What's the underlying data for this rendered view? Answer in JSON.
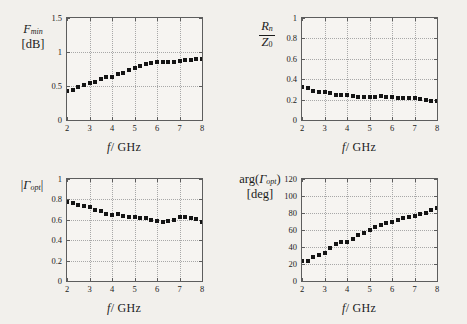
{
  "figure": {
    "background": "#f2f0ec",
    "marker_color": "#141414",
    "axis_color": "#5d5d5d",
    "grid_color": "#a8a8a8"
  },
  "chart_data": [
    {
      "type": "scatter",
      "panel": "top-left",
      "title": "",
      "ylabel": "F_min [dB]",
      "ylabel_parts": {
        "main": "F",
        "sub": "min",
        "unit": "[dB]"
      },
      "xlabel": "f / GHz",
      "xlim": [
        2,
        8
      ],
      "ylim": [
        0,
        1.5
      ],
      "xticks": [
        2,
        3,
        4,
        5,
        6,
        7,
        8
      ],
      "yticks": [
        0,
        0.5,
        1,
        1.5
      ],
      "xticklabels": [
        "2",
        "3",
        "4",
        "5",
        "6",
        "7",
        "8"
      ],
      "yticklabels": [
        "0",
        "0.5",
        "1",
        "1.5"
      ],
      "grid": true,
      "legend": "none",
      "x": [
        2.0,
        2.25,
        2.5,
        2.75,
        3.0,
        3.25,
        3.5,
        3.75,
        4.0,
        4.25,
        4.5,
        4.75,
        5.0,
        5.25,
        5.5,
        5.75,
        6.0,
        6.25,
        6.5,
        6.75,
        7.0,
        7.25,
        7.5,
        7.75,
        8.0
      ],
      "values": [
        0.43,
        0.44,
        0.49,
        0.52,
        0.55,
        0.56,
        0.6,
        0.63,
        0.63,
        0.67,
        0.69,
        0.73,
        0.76,
        0.8,
        0.82,
        0.84,
        0.85,
        0.85,
        0.86,
        0.86,
        0.87,
        0.88,
        0.88,
        0.89,
        0.9
      ]
    },
    {
      "type": "scatter",
      "panel": "top-right",
      "title": "",
      "ylabel": "Rn / Z0",
      "ylabel_parts": {
        "numerator_main": "R",
        "numerator_sub": "n",
        "denominator_main": "Z",
        "denominator_sub": "0"
      },
      "xlabel": "f / GHz",
      "xlim": [
        2,
        8
      ],
      "ylim": [
        0,
        1
      ],
      "xticks": [
        2,
        3,
        4,
        5,
        6,
        7,
        8
      ],
      "yticks": [
        0,
        0.2,
        0.4,
        0.6,
        0.8,
        1
      ],
      "xticklabels": [
        "2",
        "3",
        "4",
        "5",
        "6",
        "7",
        "8"
      ],
      "yticklabels": [
        "0",
        "0.2",
        "0.4",
        "0.6",
        "0.8",
        "1"
      ],
      "grid": true,
      "legend": "none",
      "x": [
        2.0,
        2.25,
        2.5,
        2.75,
        3.0,
        3.25,
        3.5,
        3.75,
        4.0,
        4.25,
        4.5,
        4.75,
        5.0,
        5.25,
        5.5,
        5.75,
        6.0,
        6.25,
        6.5,
        6.75,
        7.0,
        7.25,
        7.5,
        7.75,
        8.0
      ],
      "values": [
        0.32,
        0.31,
        0.28,
        0.27,
        0.275,
        0.26,
        0.25,
        0.25,
        0.245,
        0.235,
        0.23,
        0.225,
        0.23,
        0.225,
        0.235,
        0.225,
        0.225,
        0.22,
        0.215,
        0.215,
        0.22,
        0.205,
        0.2,
        0.185,
        0.19
      ]
    },
    {
      "type": "scatter",
      "panel": "bottom-left",
      "title": "",
      "ylabel": "|Gamma_opt|",
      "ylabel_parts": {
        "main": "Γ",
        "sub": "opt"
      },
      "xlabel": "f / GHz",
      "xlim": [
        2,
        8
      ],
      "ylim": [
        0,
        1
      ],
      "xticks": [
        2,
        3,
        4,
        5,
        6,
        7,
        8
      ],
      "yticks": [
        0,
        0.2,
        0.4,
        0.6,
        0.8,
        1
      ],
      "xticklabels": [
        "2",
        "3",
        "4",
        "5",
        "6",
        "7",
        "8"
      ],
      "yticklabels": [
        "0",
        "0.2",
        "0.4",
        "0.6",
        "0.8",
        "1"
      ],
      "grid": true,
      "legend": "none",
      "x": [
        2.0,
        2.25,
        2.5,
        2.75,
        3.0,
        3.25,
        3.5,
        3.75,
        4.0,
        4.25,
        4.5,
        4.75,
        5.0,
        5.25,
        5.5,
        5.75,
        6.0,
        6.25,
        6.5,
        6.75,
        7.0,
        7.25,
        7.5,
        7.75,
        8.0
      ],
      "values": [
        0.77,
        0.765,
        0.75,
        0.735,
        0.73,
        0.695,
        0.685,
        0.66,
        0.65,
        0.655,
        0.64,
        0.63,
        0.625,
        0.62,
        0.615,
        0.6,
        0.59,
        0.575,
        0.585,
        0.6,
        0.625,
        0.625,
        0.62,
        0.605,
        0.575
      ]
    },
    {
      "type": "scatter",
      "panel": "bottom-right",
      "title": "",
      "ylabel": "arg(Gamma_opt) [deg]",
      "ylabel_parts": {
        "prefix": "arg(",
        "main": "Γ",
        "sub": "opt",
        "suffix": ")",
        "unit": "[deg]"
      },
      "xlabel": "f / GHz",
      "xlim": [
        2,
        8
      ],
      "ylim": [
        0,
        120
      ],
      "xticks": [
        2,
        3,
        4,
        5,
        6,
        7,
        8
      ],
      "yticks": [
        0,
        20,
        40,
        60,
        80,
        100,
        120
      ],
      "xticklabels": [
        "2",
        "3",
        "4",
        "5",
        "6",
        "7",
        "8"
      ],
      "yticklabels": [
        "0",
        "20",
        "40",
        "60",
        "80",
        "100",
        "120"
      ],
      "grid": true,
      "legend": "none",
      "x": [
        2.0,
        2.25,
        2.5,
        2.75,
        3.0,
        3.25,
        3.5,
        3.75,
        4.0,
        4.25,
        4.5,
        4.75,
        5.0,
        5.25,
        5.5,
        5.75,
        6.0,
        6.25,
        6.5,
        6.75,
        7.0,
        7.25,
        7.5,
        7.75,
        8.0
      ],
      "values": [
        23,
        23,
        28,
        31,
        33,
        39,
        43,
        46,
        46,
        50,
        54,
        57,
        60,
        63,
        66,
        68,
        70,
        72,
        74,
        75,
        77,
        79,
        80,
        83,
        86
      ]
    }
  ]
}
